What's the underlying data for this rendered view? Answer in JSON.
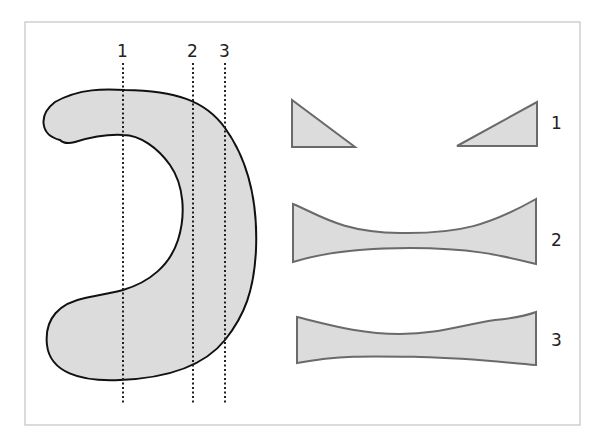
{
  "diagram": {
    "type": "cross-section illustration",
    "main_shape": "C-shaped (crescent) solid with three vertical slice planes",
    "slice_labels": [
      "1",
      "2",
      "3"
    ],
    "sections": [
      {
        "label": "1",
        "description": "Two separate right triangles (slice through both arms)"
      },
      {
        "label": "2",
        "description": "Single concave band, strongly waisted"
      },
      {
        "label": "3",
        "description": "Single concave band, mildly waisted"
      }
    ],
    "colors": {
      "fill": "#dcdcdc",
      "outline": "#111111",
      "section_outline": "#6a6a6a",
      "frame": "#c4c4c4"
    }
  }
}
